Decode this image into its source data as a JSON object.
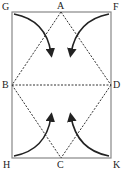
{
  "diagram": {
    "type": "folding-diagram",
    "labels": {
      "G": "G",
      "A": "A",
      "F": "F",
      "B": "B",
      "D": "D",
      "H": "H",
      "C": "C",
      "K": "K"
    },
    "caption": "",
    "colors": {
      "line": "#333333",
      "dashed": "#333333",
      "frame": "#777777"
    },
    "points": {
      "G": [
        12,
        12
      ],
      "A": [
        61,
        12
      ],
      "F": [
        111,
        12
      ],
      "B": [
        12,
        85
      ],
      "D": [
        111,
        85
      ],
      "H": [
        12,
        158
      ],
      "C": [
        61,
        158
      ],
      "K": [
        111,
        158
      ]
    }
  }
}
